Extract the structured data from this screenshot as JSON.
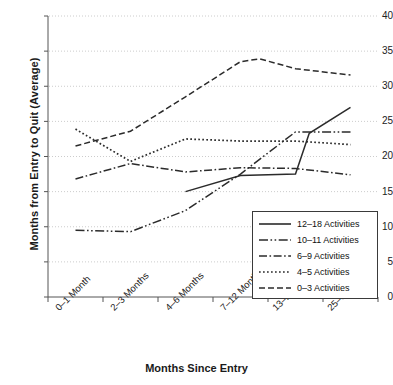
{
  "chart_data": {
    "type": "line",
    "title": "",
    "xlabel": "Months Since Entry",
    "ylabel": "Months from Entry to Quit (Average)",
    "categories": [
      "0–1 Month",
      "2–3 Months",
      "4–6 Months",
      "7–12 Months",
      "13–24 Months",
      "25–36 Months"
    ],
    "ylim": [
      0,
      40
    ],
    "yticks": [
      0,
      5,
      10,
      15,
      20,
      25,
      30,
      35,
      40
    ],
    "ytick_labels": [
      "0",
      "5",
      "10",
      "15",
      "20",
      "25",
      "30",
      "35",
      "40"
    ],
    "grid": true,
    "grid_style": "dotted horizontal",
    "legend_position": "lower right inside",
    "series": [
      {
        "name": "12–18 Activities",
        "style": "solid",
        "values": [
          null,
          null,
          15.0,
          17.3,
          17.5,
          27.0
        ],
        "extra_points": [
          {
            "x": 4.25,
            "y": 23.3
          }
        ]
      },
      {
        "name": "10–11 Activities",
        "style": "dash-dot-dot",
        "values": [
          9.5,
          9.3,
          12.3,
          17.5,
          23.5,
          23.5
        ]
      },
      {
        "name": "6–9 Activities",
        "style": "dash-dot",
        "values": [
          16.8,
          19.0,
          17.8,
          18.4,
          18.3,
          17.4
        ]
      },
      {
        "name": "4–5 Activities",
        "style": "dotted",
        "values": [
          23.9,
          19.3,
          22.5,
          22.2,
          22.2,
          21.7
        ]
      },
      {
        "name": "0–3 Activities",
        "style": "dashed",
        "values": [
          21.5,
          23.6,
          28.5,
          33.5,
          32.5,
          31.6
        ],
        "extra_points": [
          {
            "x": 3.35,
            "y": 33.9
          }
        ]
      }
    ]
  },
  "legend": {
    "items": [
      {
        "label": "12–18 Activities",
        "style": "solid"
      },
      {
        "label": "10–11 Activities",
        "style": "dash-dot-dot"
      },
      {
        "label": "6–9 Activities",
        "style": "dash-dot"
      },
      {
        "label": "4–5 Activities",
        "style": "dotted"
      },
      {
        "label": "0–3 Activities",
        "style": "dashed"
      }
    ]
  },
  "colors": {
    "line": "#2b2b2b",
    "axis": "#555555",
    "grid": "#cccccc",
    "text": "#1a1a1a",
    "background": "#ffffff"
  }
}
